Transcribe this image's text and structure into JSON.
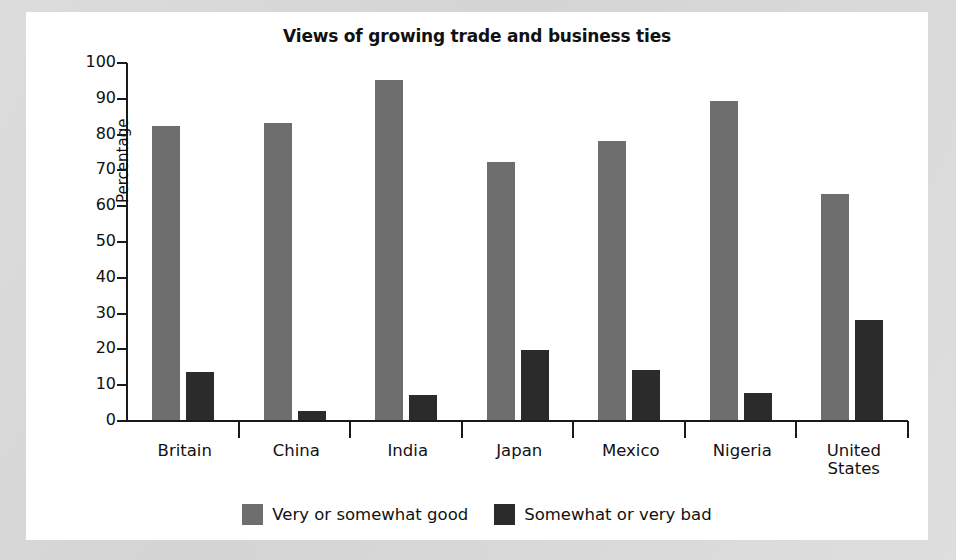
{
  "chart_data": {
    "type": "bar",
    "title": "Views of growing trade and business ties",
    "xlabel": "",
    "ylabel": "Percentage",
    "ylim": [
      0,
      100
    ],
    "ytick_step": 10,
    "yticks": [
      100,
      90,
      80,
      70,
      60,
      50,
      40,
      30,
      20,
      10,
      0
    ],
    "grid": false,
    "legend_position": "bottom-center",
    "categories": [
      "Britain",
      "China",
      "India",
      "Japan",
      "Mexico",
      "Nigeria",
      "United States"
    ],
    "category_lines": [
      [
        "Britain"
      ],
      [
        "China"
      ],
      [
        "India"
      ],
      [
        "Japan"
      ],
      [
        "Mexico"
      ],
      [
        "Nigeria"
      ],
      [
        "United",
        "States"
      ]
    ],
    "series": [
      {
        "name": "Very or somewhat good",
        "color": "#6e6e6e",
        "values": [
          82,
          83,
          95,
          72,
          78,
          89,
          63
        ]
      },
      {
        "name": "Somewhat or very bad",
        "color": "#2b2b2b",
        "values": [
          13.5,
          2.5,
          7,
          19.5,
          14,
          7.5,
          28
        ]
      }
    ]
  },
  "legend": {
    "entries": [
      {
        "label": "Very or somewhat good",
        "swatch": "good"
      },
      {
        "label": "Somewhat or very bad",
        "swatch": "bad"
      }
    ]
  },
  "colors": {
    "good_bar": "#6e6e6e",
    "bad_bar": "#2b2b2b",
    "axis": "#1a1a1a",
    "panel_background": "#ffffff",
    "page_background": "#d9d9d9"
  }
}
